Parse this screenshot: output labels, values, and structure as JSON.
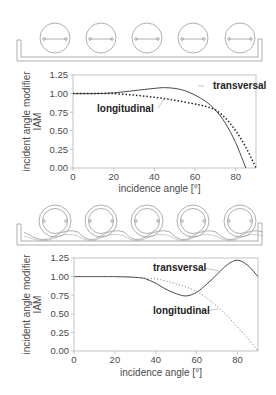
{
  "figure": {
    "top_illustration": {
      "tubes": 5,
      "type": "flat-absorber tubes in trough"
    },
    "bottom_illustration": {
      "tubes": 5,
      "type": "double-glass tubes with CPC reflector"
    }
  },
  "chart_data": [
    {
      "type": "line",
      "title": "",
      "xlabel": "incidence angle [°]",
      "ylabel": "incident angle modifier IAM",
      "ylabel_lines": [
        "incident angle modifier",
        "IAM"
      ],
      "xlim": [
        0,
        90
      ],
      "ylim": [
        0,
        1.25
      ],
      "xticks": [
        0,
        20,
        40,
        60,
        80
      ],
      "xtick_labels": [
        "0",
        "20",
        "40",
        "60",
        "80"
      ],
      "yticks": [
        0,
        0.25,
        0.5,
        0.75,
        1.0,
        1.25
      ],
      "ytick_labels": [
        "0.00",
        "0.25",
        "0.50",
        "0.75",
        "1.00",
        "1.25"
      ],
      "grid": false,
      "legend": "inline annotations",
      "series": [
        {
          "name": "transversal",
          "style": "solid",
          "x": [
            0,
            10,
            20,
            30,
            40,
            45,
            50,
            55,
            60,
            65,
            70,
            75,
            80,
            85
          ],
          "y": [
            1.0,
            1.0,
            1.01,
            1.04,
            1.07,
            1.08,
            1.07,
            1.04,
            0.98,
            0.9,
            0.78,
            0.6,
            0.34,
            0.0
          ]
        },
        {
          "name": "longitudinal",
          "style": "dotted",
          "x": [
            0,
            10,
            15,
            20,
            30,
            40,
            50,
            60,
            65,
            70,
            75,
            80,
            85,
            90
          ],
          "y": [
            1.0,
            1.0,
            1.0,
            1.0,
            0.98,
            0.95,
            0.91,
            0.86,
            0.83,
            0.78,
            0.67,
            0.5,
            0.28,
            0.0
          ]
        }
      ],
      "annotations": [
        {
          "text": "transversal",
          "x": 72,
          "y": 1.07
        },
        {
          "text": "longitudinal",
          "x": 22,
          "y": 0.8
        }
      ]
    },
    {
      "type": "line",
      "title": "",
      "xlabel": "incidence angle [°]",
      "ylabel": "incident angle modifier IAM",
      "ylabel_lines": [
        "incident angle modifier",
        "IAM"
      ],
      "xlim": [
        0,
        90
      ],
      "ylim": [
        0,
        1.25
      ],
      "xticks": [
        0,
        20,
        40,
        60,
        80
      ],
      "xtick_labels": [
        "0",
        "20",
        "40",
        "60",
        "80"
      ],
      "yticks": [
        0,
        0.25,
        0.5,
        0.75,
        1.0,
        1.25
      ],
      "ytick_labels": [
        "0.00",
        "0.25",
        "0.50",
        "0.75",
        "1.00",
        "1.25"
      ],
      "grid": false,
      "legend": "inline annotations",
      "series": [
        {
          "name": "transversal",
          "style": "solid",
          "x": [
            0,
            10,
            20,
            30,
            35,
            40,
            45,
            50,
            55,
            60,
            65,
            70,
            75,
            80,
            85,
            90
          ],
          "y": [
            1.0,
            1.0,
            1.0,
            0.99,
            0.97,
            0.91,
            0.83,
            0.77,
            0.74,
            0.79,
            0.9,
            1.03,
            1.16,
            1.22,
            1.15,
            1.0
          ]
        },
        {
          "name": "longitudinal",
          "style": "dotted",
          "x": [
            0,
            10,
            20,
            30,
            35,
            40,
            45,
            50,
            55,
            60,
            65,
            70,
            75,
            80,
            85,
            90
          ],
          "y": [
            1.0,
            1.0,
            1.0,
            0.99,
            0.98,
            0.97,
            0.94,
            0.9,
            0.86,
            0.8,
            0.71,
            0.6,
            0.47,
            0.32,
            0.17,
            0.0
          ]
        }
      ],
      "annotations": [
        {
          "text": "transversal",
          "x": 28,
          "y": 1.08
        },
        {
          "text": "longitudinal",
          "x": 28,
          "y": 0.56
        }
      ]
    }
  ]
}
